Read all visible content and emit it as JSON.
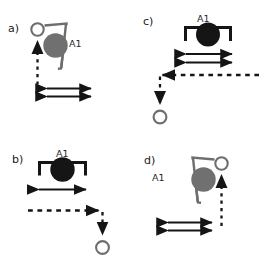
{
  "figure": {
    "type": "technical-diagram",
    "colors": {
      "black": "#151515",
      "gray": "#6e6e6e",
      "gray_fill": "#707070",
      "open_circle_stroke": "#6e6e6e",
      "background": "#ffffff"
    }
  },
  "panels": [
    {
      "id": "a",
      "label": "a)",
      "arm_label": "A1",
      "arm_color": "gray",
      "arm_orientation": "tilted",
      "object": "filled-circle-gray",
      "target": "open-circle",
      "target_position": "above-left",
      "path_arrow": {
        "direction": "up",
        "style": "dashed"
      },
      "measure_arrows": 2,
      "measure_arrow_style": "solid-double-headed"
    },
    {
      "id": "c",
      "label": "c)",
      "arm_label": "A1",
      "arm_color": "black",
      "arm_orientation": "upright",
      "object": "filled-circle-black",
      "target": "open-circle",
      "target_position": "below-left",
      "path_arrow": {
        "direction": "left-then-down",
        "style": "dashed"
      },
      "measure_arrows": 2,
      "measure_arrow_style": "solid-double-headed"
    },
    {
      "id": "b",
      "label": "b)",
      "arm_label": "A1",
      "arm_color": "black",
      "arm_orientation": "upright",
      "object": "filled-circle-black",
      "target": "open-circle",
      "target_position": "below-right",
      "path_arrow": {
        "direction": "right-then-down",
        "style": "dashed"
      },
      "measure_arrows": 1,
      "measure_arrow_style": "solid-double-headed"
    },
    {
      "id": "d",
      "label": "d)",
      "arm_label": "A1",
      "arm_color": "gray",
      "arm_orientation": "tilted-mirrored",
      "object": "filled-circle-gray",
      "target": "open-circle",
      "target_position": "above-right",
      "path_arrow": {
        "direction": "up",
        "style": "dashed"
      },
      "measure_arrows": 2,
      "measure_arrow_style": "solid-double-headed"
    }
  ]
}
